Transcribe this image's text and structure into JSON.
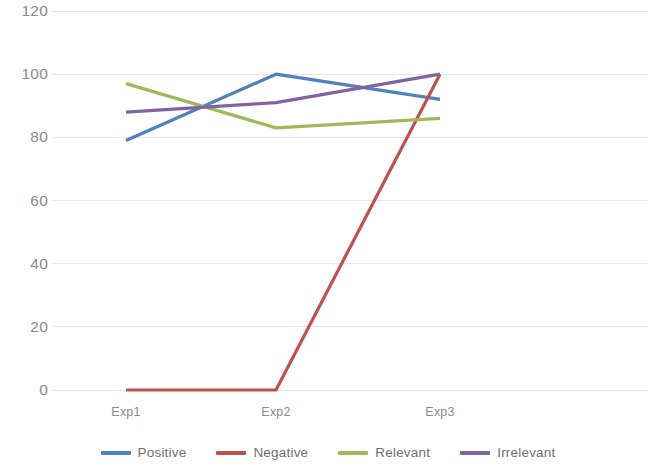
{
  "chart_data": {
    "type": "line",
    "title": "",
    "subtitle": "",
    "xlabel": "",
    "ylabel": "",
    "categories": [
      "Exp1",
      "Exp2",
      "Exp3"
    ],
    "ylim": [
      0,
      120
    ],
    "y_ticks": [
      0,
      20,
      40,
      60,
      80,
      100,
      120
    ],
    "y_tick_labels": [
      "0",
      "20",
      "40",
      "60",
      "80",
      "100",
      "120"
    ],
    "grid": true,
    "grid_axis": "y",
    "legend_position": "bottom",
    "series": [
      {
        "name": "Positive",
        "values": [
          79,
          100,
          92
        ],
        "color": "#4F81BD"
      },
      {
        "name": "Negative",
        "values": [
          0,
          0,
          100
        ],
        "color": "#C0504D"
      },
      {
        "name": "Relevant",
        "values": [
          97,
          83,
          86
        ],
        "color": "#9BBB59"
      },
      {
        "name": "Irrelevant",
        "values": [
          88,
          91,
          100
        ],
        "color": "#8064A2"
      }
    ]
  },
  "axes": {
    "y_tick_labels": [
      "120",
      "100",
      "80",
      "60",
      "40",
      "20",
      "0"
    ],
    "x_tick_labels": [
      "Exp1",
      "Exp2",
      "Exp3"
    ]
  },
  "legend": {
    "items": [
      {
        "label": "Positive",
        "color": "#4F81BD"
      },
      {
        "label": "Negative",
        "color": "#C0504D"
      },
      {
        "label": "Relevant",
        "color": "#9BBB59"
      },
      {
        "label": "Irrelevant",
        "color": "#8064A2"
      }
    ]
  },
  "colors": {
    "grid": "#E6E6E6",
    "tick_text": "#8A8A8A",
    "legend_text": "#6F6F6F",
    "background": "#FFFFFF"
  }
}
